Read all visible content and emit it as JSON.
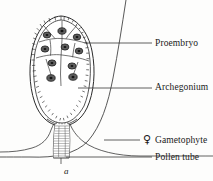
{
  "figure": {
    "caption_letter": "a",
    "background_color": "#fdfdfc",
    "ink_color": "#2b2b2b",
    "labels": [
      {
        "id": "proembryo",
        "text": "Proembryo",
        "symbol": ""
      },
      {
        "id": "archegonium",
        "text": "Archegonium",
        "symbol": ""
      },
      {
        "id": "gametophyte",
        "text": "Gametophyte",
        "symbol": "♀"
      },
      {
        "id": "pollen_tube",
        "text": "Pollen tube",
        "symbol": ""
      }
    ],
    "symbols": {
      "venus_female": "♀"
    },
    "structures": [
      {
        "name": "archegonium-wall",
        "description": "ovate jacket of small rectangular cells"
      },
      {
        "name": "proembryo-cells",
        "description": "tiered cells with dark nuclei at apex"
      },
      {
        "name": "proembryo-nuclei",
        "count": 9
      },
      {
        "name": "gametophyte-curve",
        "description": "large sweeping outer contour"
      },
      {
        "name": "pollen-tube",
        "description": "hatched tube entering archegonium neck"
      }
    ]
  }
}
